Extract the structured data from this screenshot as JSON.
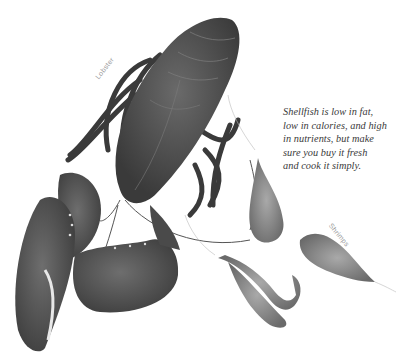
{
  "caption": {
    "lines": [
      "Shellfish is low in fat,",
      "low in calories, and high",
      "in nutrients, but make",
      "sure you buy it fresh",
      "and cook it simply."
    ]
  },
  "labels": {
    "lobster": "Lobster",
    "shrimps": "Shrimps"
  },
  "colors": {
    "background": "#ffffff",
    "lobster_body": "#4a4a4a",
    "lobster_dark": "#2e2e2e",
    "shrimp_body": "#8a8a8a",
    "caption_text": "#3a3a3a",
    "label_text": "#9a9a9a"
  }
}
